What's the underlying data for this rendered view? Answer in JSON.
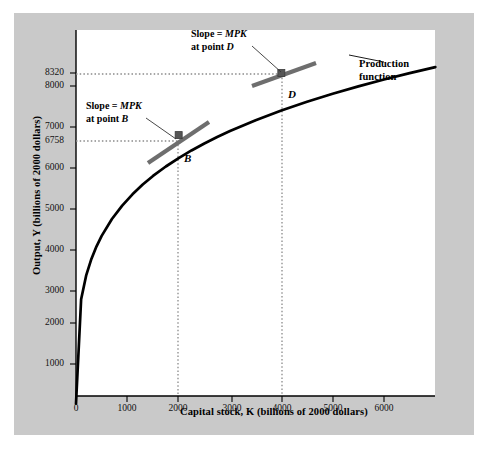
{
  "chart_data": {
    "type": "line",
    "title": "",
    "xlabel": "Capital stock, K (billions of 2000 dollars)",
    "ylabel": "Output, Y (billions of 2000 dollars)",
    "xlim": [
      0,
      7000
    ],
    "ylim": [
      0,
      9000
    ],
    "xticks": [
      0,
      1000,
      2000,
      3000,
      4000,
      5000,
      6000
    ],
    "xtick_labels": [
      "0",
      "1000",
      "2000",
      "3000",
      "4000",
      "5000",
      "6000"
    ],
    "yticks": [
      1000,
      2000,
      3000,
      4000,
      5000,
      6000,
      6758,
      7000,
      8000,
      8320
    ],
    "ytick_labels": [
      "1000",
      "2000",
      "3000",
      "4000",
      "5000",
      "6000",
      "6758",
      "7000",
      "8000",
      "8320"
    ],
    "grid": false,
    "legend_position": "none",
    "series": [
      {
        "name": "Production function",
        "curve_form": "Y = A * K^0.3",
        "x": [
          0,
          100,
          200,
          300,
          400,
          500,
          700,
          900,
          1100,
          1300,
          1500,
          1750,
          2000,
          2250,
          2500,
          2750,
          3000,
          3500,
          4000,
          4500,
          5000,
          5500,
          6000,
          6500,
          7000
        ],
        "y": [
          0,
          2630,
          3237,
          3643,
          3960,
          4222,
          4647,
          4985,
          5268,
          5513,
          5730,
          5968,
          6180,
          6372,
          6548,
          6710,
          6860,
          7133,
          7377,
          7597,
          7798,
          7983,
          8155,
          8316,
          8467
        ]
      }
    ],
    "points": [
      {
        "label": "B",
        "x": 2000,
        "y": 6758,
        "marker": "square",
        "color": "#555555"
      },
      {
        "label": "D",
        "x": 4000,
        "y": 8320,
        "marker": "square",
        "color": "#555555"
      }
    ],
    "annotations": [
      {
        "name": "slope-b",
        "line1": "Slope = ",
        "italic1": "MPK",
        "line2": "at point ",
        "italic2": "B",
        "points_to": "B"
      },
      {
        "name": "slope-d",
        "line1": "Slope = ",
        "italic1": "MPK",
        "line2": "at point ",
        "italic2": "D",
        "points_to": "D"
      },
      {
        "name": "curve-label",
        "line1": "Production",
        "line2": "function"
      }
    ],
    "dropline_values": {
      "B": {
        "x": 2000,
        "y": 6758
      },
      "D": {
        "x": 4000,
        "y": 8320
      }
    }
  },
  "axes": {
    "y_title": "Output, Y (billions of 2000 dollars)",
    "x_title": "Capital stock, K (billions of 2000 dollars)",
    "y_ticks": [
      {
        "value": 8320,
        "label": "8320",
        "px": 73
      },
      {
        "value": 8000,
        "label": "8000",
        "px": 86
      },
      {
        "value": 7000,
        "label": "7000",
        "px": 127
      },
      {
        "value": 6758,
        "label": "6758",
        "px": 141
      },
      {
        "value": 6000,
        "label": "6000",
        "px": 168
      },
      {
        "value": 5000,
        "label": "5000",
        "px": 209
      },
      {
        "value": 4000,
        "label": "4000",
        "px": 250
      },
      {
        "value": 3000,
        "label": "3000",
        "px": 291
      },
      {
        "value": 2000,
        "label": "2000",
        "px": 323
      },
      {
        "value": 1000,
        "label": "1000",
        "px": 364
      }
    ],
    "x_ticks": [
      {
        "value": 0,
        "label": "0",
        "px": 76
      },
      {
        "value": 1000,
        "label": "1000",
        "px": 127
      },
      {
        "value": 2000,
        "label": "2000",
        "px": 178
      },
      {
        "value": 3000,
        "label": "3000",
        "px": 232
      },
      {
        "value": 4000,
        "label": "4000",
        "px": 282
      },
      {
        "value": 5000,
        "label": "5000",
        "px": 333
      },
      {
        "value": 6000,
        "label": "6000",
        "px": 384
      }
    ]
  },
  "labels": {
    "slope_b_line1_pre": "Slope = ",
    "slope_b_line1_it": "MPK",
    "slope_b_line2_pre": "at point ",
    "slope_b_line2_it": "B",
    "slope_d_line1_pre": "Slope = ",
    "slope_d_line1_it": "MPK",
    "slope_d_line2_pre": "at point ",
    "slope_d_line2_it": "D",
    "point_b": "B",
    "point_d": "D",
    "prod_line1": "Production",
    "prod_line2": "function"
  },
  "colors": {
    "panel_bg": "#c9c9c9",
    "plot_bg": "#ffffff",
    "curve": "#000000",
    "tangent": "#6a6a6a",
    "marker": "#555555",
    "dotted": "#8a8a8a",
    "text": "#000000"
  }
}
